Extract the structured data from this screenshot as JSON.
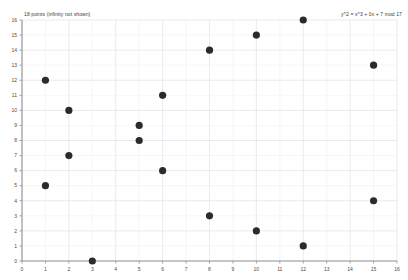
{
  "caption": {
    "left": "18 points (infinity not shown)",
    "right": "y^2 = x^3 + 0x + 7 mod 17"
  },
  "colors": {
    "point": "#2b2b2b",
    "grid_major": "#d9dde4",
    "grid_minor": "#e9ecf1",
    "axis": "#8d8d8d",
    "background": "#ffffff",
    "tick_text": "#4a4a4a"
  },
  "chart_data": {
    "type": "scatter",
    "title": "18 points (infinity not shown)",
    "annotation": "y^2 = x^3 + 0x + 7 mod 17",
    "xlabel": "",
    "ylabel": "",
    "xlim": [
      0,
      16
    ],
    "ylim": [
      0,
      16
    ],
    "grid": true,
    "legend": false,
    "xticks": [
      0,
      1,
      2,
      3,
      4,
      5,
      6,
      7,
      8,
      9,
      10,
      11,
      12,
      13,
      14,
      15,
      16
    ],
    "yticks": [
      0,
      1,
      2,
      3,
      4,
      5,
      6,
      7,
      8,
      9,
      10,
      11,
      12,
      13,
      14,
      15,
      16
    ],
    "xtick_labels": [
      "0",
      "1",
      "2",
      "3",
      "4",
      "5",
      "6",
      "7",
      "8",
      "9",
      "10",
      "11",
      "12",
      "13",
      "14",
      "15",
      "16"
    ],
    "ytick_labels": [
      "0",
      "1",
      "2",
      "3",
      "4",
      "5",
      "6",
      "7",
      "8",
      "9",
      "10",
      "11",
      "12",
      "13",
      "14",
      "15",
      "16"
    ],
    "point_count": 18,
    "points": [
      {
        "x": 1,
        "y": 5
      },
      {
        "x": 1,
        "y": 12
      },
      {
        "x": 2,
        "y": 7
      },
      {
        "x": 2,
        "y": 10
      },
      {
        "x": 3,
        "y": 0
      },
      {
        "x": 5,
        "y": 8
      },
      {
        "x": 5,
        "y": 9
      },
      {
        "x": 6,
        "y": 6
      },
      {
        "x": 6,
        "y": 11
      },
      {
        "x": 8,
        "y": 3
      },
      {
        "x": 8,
        "y": 14
      },
      {
        "x": 10,
        "y": 2
      },
      {
        "x": 10,
        "y": 15
      },
      {
        "x": 12,
        "y": 1
      },
      {
        "x": 12,
        "y": 16
      },
      {
        "x": 15,
        "y": 4
      },
      {
        "x": 15,
        "y": 13
      }
    ]
  }
}
